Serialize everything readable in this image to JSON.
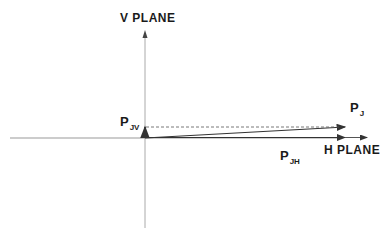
{
  "diagram": {
    "v_plane_label": "V PLANE",
    "h_plane_label": "H PLANE",
    "vectors": [
      {
        "name": "P",
        "subscript": "J",
        "description": "resultant vector"
      },
      {
        "name": "P",
        "subscript": "JV",
        "description": "vertical component"
      },
      {
        "name": "P",
        "subscript": "JH",
        "description": "horizontal component"
      }
    ],
    "colors": {
      "line": "#333333",
      "axis": "#999999",
      "text": "#1a1a1a"
    }
  }
}
